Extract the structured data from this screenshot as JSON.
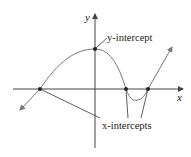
{
  "diagram": {
    "axis_x_label": "x",
    "axis_y_label": "y",
    "y_intercept_label": "y-intercept",
    "x_intercepts_label": "x-intercepts",
    "colors": {
      "axis": "#444444",
      "curve": "#777777",
      "point": "#222222",
      "leader": "#333333"
    }
  }
}
